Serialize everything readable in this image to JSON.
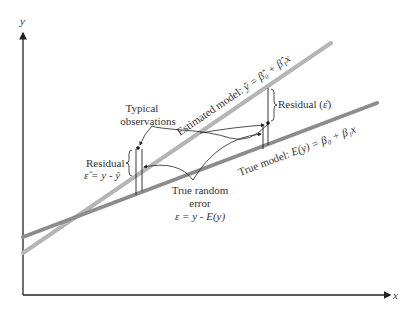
{
  "axes": {
    "x_label": "x",
    "y_label": "y"
  },
  "lines": {
    "estimated": {
      "name": "Estimated model",
      "label_prefix": "Estimated model: ",
      "equation": "ŷ = β̂₀ + β̂₁x",
      "color": "#b5b5b5"
    },
    "true": {
      "name": "True model",
      "label_prefix": "True model: ",
      "equation": "E(y) = β₀ + β₁x",
      "color": "#8c8c8c"
    }
  },
  "annotations": {
    "typical_line1": "Typical",
    "typical_line2": "observations",
    "residual_right": "Residual (ε̂)",
    "residual_left_line1": "Residual",
    "residual_left_line2": "ε̂ = y - ŷ",
    "true_error_line1": "True random",
    "true_error_line2": "error",
    "true_error_line3": "ε = y - E(y)"
  }
}
